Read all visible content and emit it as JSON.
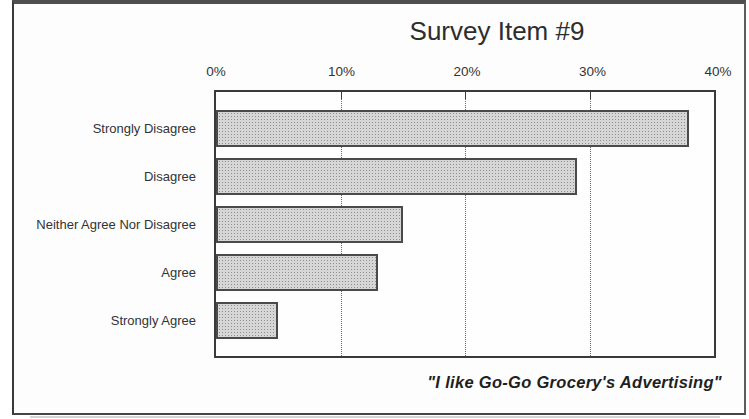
{
  "figure": {
    "title": "Survey Item #9",
    "caption": "\"I like Go-Go Grocery's Advertising\""
  },
  "chart_data": {
    "type": "bar",
    "orientation": "horizontal",
    "title": "Survey Item #9",
    "categories": [
      "Strongly Disagree",
      "Disagree",
      "Neither Agree Nor Disagree",
      "Agree",
      "Strongly Agree"
    ],
    "values": [
      38,
      29,
      15,
      13,
      5
    ],
    "value_unit": "%",
    "xlabel": "",
    "ylabel": "",
    "xlim": [
      0,
      40
    ],
    "x_tick_labels": [
      "0%",
      "10%",
      "20%",
      "30%",
      "40%"
    ],
    "gridlines": {
      "style": "dotted-vertical",
      "positions_pct": [
        10,
        20,
        30
      ]
    },
    "legend": "none",
    "annotation": "\"I like Go-Go Grocery's Advertising\"",
    "colors": {
      "bar_fill": "#d6d6d6",
      "bar_stipple": "#909090",
      "bar_border": "#4a4a4a",
      "plot_border": "#3a3a3a",
      "text": "#2e2e2e",
      "frame": "#4f4f4f"
    }
  }
}
